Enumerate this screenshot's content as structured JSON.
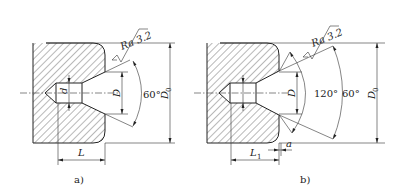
{
  "figure_a": {
    "caption": "a)",
    "roughness": "Ra 3.2",
    "angle_cone": "60°",
    "dim_d": "d",
    "dim_D": "D",
    "dim_D0": "D",
    "dim_D0_sub": "0",
    "dim_L": "L"
  },
  "figure_b": {
    "caption": "b)",
    "roughness": "Ra 3.2",
    "angle_inner": "120°",
    "angle_cone": "60°",
    "dim_D": "D",
    "dim_D0": "D",
    "dim_D0_sub": "0",
    "dim_L1": "L",
    "dim_L1_sub": "1",
    "dim_a": "a"
  }
}
